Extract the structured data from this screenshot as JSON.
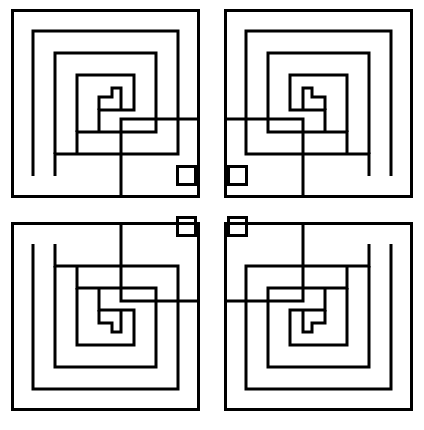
{
  "figure": {
    "name": "four-fold-symmetric-meander-labyrinth",
    "title": "Four-fold symmetric Greek-key meander pattern",
    "canvas": {
      "width": 424,
      "height": 430
    },
    "background_color": "#ffffff",
    "line_color": "#000000",
    "line_width": 3,
    "grid_pitch": 22,
    "symmetry": "2x2 mirrored quadrants (horizontal, vertical and 180-degree rotational)",
    "quadrant_count": 4,
    "center_square_count": 4
  },
  "quadrants": [
    {
      "name": "top-left",
      "transform": "identity",
      "origin_x": 11,
      "origin_y": 9,
      "size": 189
    },
    {
      "name": "top-right",
      "transform": "mirror-horizontal",
      "origin_x": 224,
      "origin_y": 9,
      "size": 189
    },
    {
      "name": "bottom-left",
      "transform": "mirror-vertical",
      "origin_x": 11,
      "origin_y": 222,
      "size": 189
    },
    {
      "name": "bottom-right",
      "transform": "rotate-180",
      "origin_x": 224,
      "origin_y": 222,
      "size": 189
    }
  ],
  "center_squares": [
    {
      "name": "center-square-top-left",
      "x": 176,
      "y": 165,
      "size": 21
    },
    {
      "name": "center-square-top-right",
      "x": 227,
      "y": 165,
      "size": 21
    },
    {
      "name": "center-square-bottom-left",
      "x": 176,
      "y": 216,
      "size": 21
    },
    {
      "name": "center-square-bottom-right",
      "x": 227,
      "y": 216,
      "size": 21
    }
  ],
  "geometry": {
    "quadrant_outline": [
      [
        0,
        0
      ],
      [
        189,
        0
      ],
      [
        189,
        189
      ],
      [
        0,
        189
      ]
    ],
    "spiral_arms": [
      {
        "index": 0,
        "inset": 22,
        "arm_end": 167
      },
      {
        "index": 1,
        "inset": 44,
        "arm_end": 145
      },
      {
        "index": 2,
        "inset": 66,
        "arm_end": 123
      },
      {
        "index": 3,
        "inset": 88,
        "arm_end": 101
      }
    ],
    "notes": "Each quadrant is an outer square band plus nested L/spiral arms on a 22 px pitch; arms open toward the figure centre and terminate in stepped returns."
  }
}
